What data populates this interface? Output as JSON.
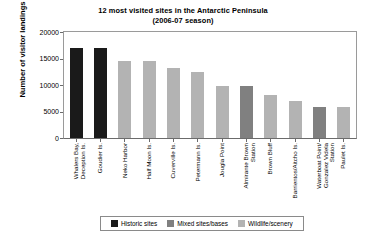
{
  "chart_data": {
    "type": "bar",
    "title": "12 most visited sites in the Antarctic Peninsula",
    "subtitle": "(2006-07 season)",
    "xlabel": "",
    "ylabel": "Number of visitor landings",
    "ylim": [
      0,
      20000
    ],
    "yticks": [
      20000,
      15000,
      10000,
      5000,
      0
    ],
    "grid": false,
    "legend_position": "bottom",
    "categories": [
      "Whalers Bay, Deception Is.",
      "Goudier Is.",
      "Neko Harbor",
      "Half Moon Is.",
      "Cuverville Is.",
      "Petermann Is.",
      "Jougla Point",
      "Almirante Brown Station",
      "Brown Bluff",
      "Barrientos/Aitcho Is.",
      "Waterboat Point/ Gonzalez Videla Station",
      "Paulet Is."
    ],
    "category_lines": [
      [
        "Whalers Bay,",
        "Deception Is."
      ],
      [
        "Goudier Is."
      ],
      [
        "Neko Harbor"
      ],
      [
        "Half Moon Is."
      ],
      [
        "Cuverville Is."
      ],
      [
        "Petermann Is."
      ],
      [
        "Jougla Point"
      ],
      [
        "Almirante Brown",
        "Station"
      ],
      [
        "Brown Bluff"
      ],
      [
        "Barrientos/Aitcho Is."
      ],
      [
        "Waterboat Point/",
        "Gonzalez Videla",
        "Station"
      ],
      [
        "Paulet Is."
      ]
    ],
    "values": [
      16900,
      16900,
      14600,
      14500,
      13300,
      12400,
      9900,
      9800,
      8200,
      7000,
      5900,
      5800
    ],
    "bar_categories": [
      "historic",
      "historic",
      "wildlife",
      "wildlife",
      "wildlife",
      "wildlife",
      "wildlife",
      "mixed",
      "wildlife",
      "wildlife",
      "mixed",
      "wildlife"
    ],
    "legend": [
      {
        "key": "historic",
        "label": "Historic sites",
        "color": "#1a1a1a"
      },
      {
        "key": "mixed",
        "label": "Mixed sites/bases",
        "color": "#808080"
      },
      {
        "key": "wildlife",
        "label": "Wildlife/scenery",
        "color": "#b3b3b3"
      }
    ]
  },
  "colors": {
    "historic": "#1a1a1a",
    "mixed": "#808080",
    "wildlife": "#b3b3b3",
    "axis": "#6b6b6b",
    "frame": "#9a9a9a",
    "background": "#ffffff"
  }
}
